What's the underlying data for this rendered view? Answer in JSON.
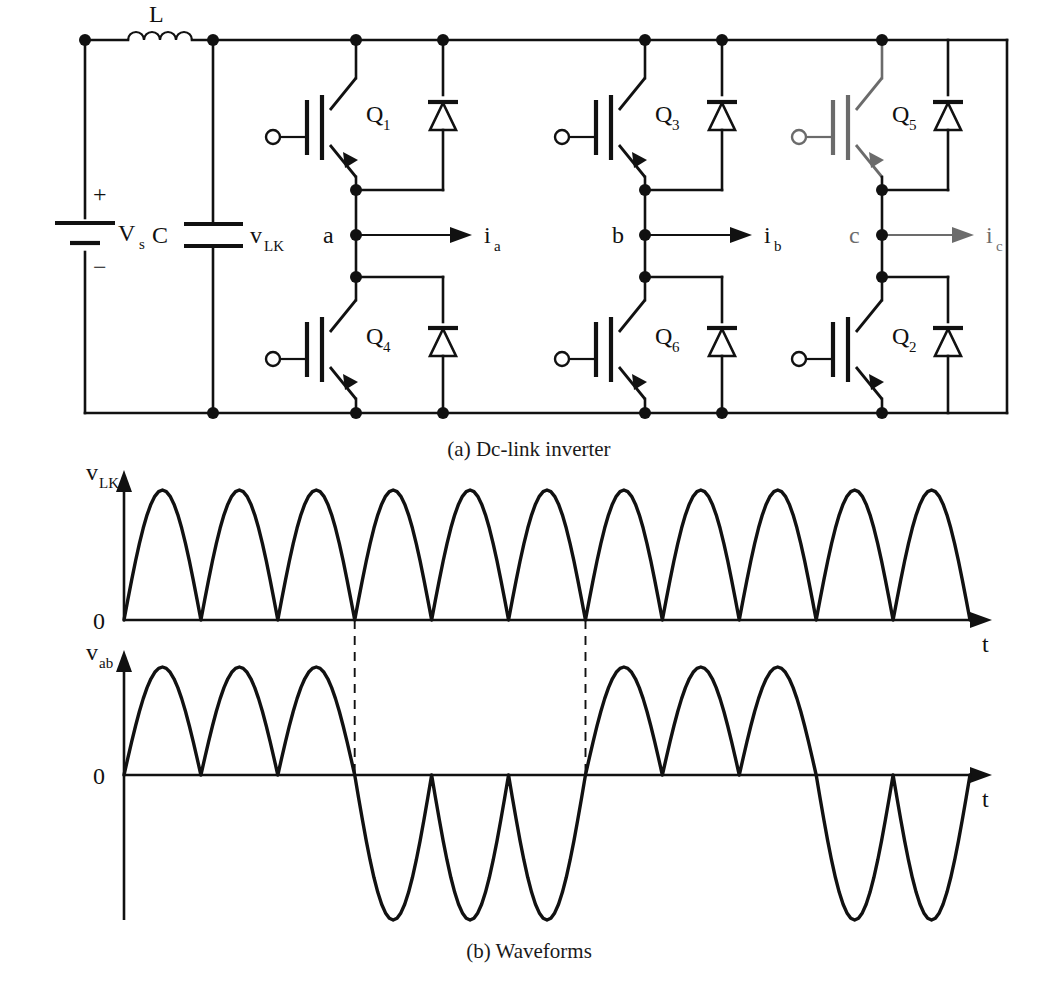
{
  "figure": {
    "captions": {
      "a": "(a) Dc-link inverter",
      "b": "(b) Waveforms"
    }
  },
  "circuit": {
    "labels": {
      "inductor": "L",
      "source": "V",
      "source_sub": "s",
      "plus": "+",
      "minus": "−",
      "capacitor": "C",
      "cap_voltage": "v",
      "cap_voltage_sub": "LK",
      "node_a": "a",
      "node_b": "b",
      "node_c": "c",
      "current_a": "i",
      "current_a_sub": "a",
      "current_b": "i",
      "current_b_sub": "b",
      "current_c": "i",
      "current_c_sub": "c"
    },
    "transistors": [
      {
        "name": "Q",
        "sub": "1",
        "leg": "a",
        "position": "upper"
      },
      {
        "name": "Q",
        "sub": "4",
        "leg": "a",
        "position": "lower"
      },
      {
        "name": "Q",
        "sub": "3",
        "leg": "b",
        "position": "upper"
      },
      {
        "name": "Q",
        "sub": "6",
        "leg": "b",
        "position": "lower"
      },
      {
        "name": "Q",
        "sub": "5",
        "leg": "c",
        "position": "upper"
      },
      {
        "name": "Q",
        "sub": "2",
        "leg": "c",
        "position": "lower"
      }
    ],
    "diode_count": 6,
    "gate_terminal_count": 6,
    "colors": {
      "ink": "#111111",
      "paper": "#ffffff"
    }
  },
  "chart_data": [
    {
      "type": "line",
      "name": "v_LK",
      "title": "",
      "ylabel": "v_LK",
      "ylabel_main": "v",
      "ylabel_sub": "LK",
      "xlabel": "t",
      "ytick_zero": "0",
      "grid": false,
      "legend": "none",
      "waveform": "rectified-sine",
      "arch_count": 11,
      "polarity": "all-positive",
      "amplitude": 1.0,
      "ylim": [
        0,
        1.15
      ],
      "description": "Full-wave rectified sinusoid, eleven positive half-sine arches of equal height resting on the zero axis."
    },
    {
      "type": "line",
      "name": "v_ab",
      "title": "",
      "ylabel": "v_ab",
      "ylabel_main": "v",
      "ylabel_sub": "ab",
      "xlabel": "t",
      "ytick_zero": "0",
      "grid": false,
      "legend": "none",
      "waveform": "alternating-half-sine-groups",
      "group_pattern": [
        {
          "sign": "+",
          "count": 3
        },
        {
          "sign": "-",
          "count": 3
        },
        {
          "sign": "+",
          "count": 3
        },
        {
          "sign": "-",
          "count": 2
        }
      ],
      "arch_count": 11,
      "amplitude_positive": 1.0,
      "amplitude_negative": -1.45,
      "ylim": [
        -1.6,
        1.15
      ],
      "description": "Quasi-square modulated output: three positive half-sine pulses, three negative half-sine pulses, three positive, then two negative."
    }
  ],
  "annotations": {
    "dashed_markers": 2,
    "dashed_note": "Two vertical dashed lines link v_LK zero crossings to the v_ab polarity reversals."
  }
}
